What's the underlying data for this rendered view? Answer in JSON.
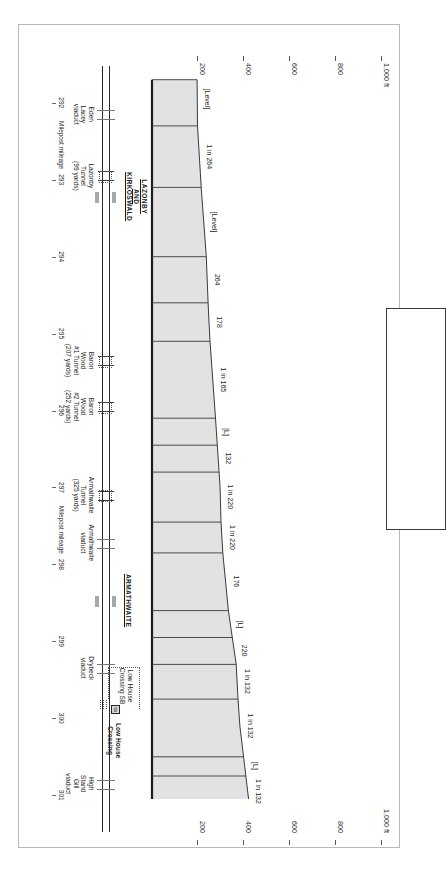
{
  "figure": {
    "kind": "railway-gradient-profile",
    "orientation": "rotated-90-clockwise",
    "elevation_axis": {
      "unit_label": "1,000 ft",
      "ticks": [
        "1,000 ft",
        "800",
        "600",
        "400",
        "200"
      ],
      "values": [
        1000,
        800,
        600,
        400,
        200
      ]
    },
    "mileage_axis": {
      "caption": "Milepost mileage",
      "ticks": [
        "292",
        "293",
        "294",
        "295",
        "296",
        "297",
        "298",
        "299",
        "300",
        "301"
      ],
      "values": [
        292,
        293,
        294,
        295,
        296,
        297,
        298,
        299,
        300,
        301
      ]
    }
  },
  "chart_data": {
    "type": "area",
    "title": "",
    "xlabel": "Milepost mileage",
    "ylabel": "1,000 ft",
    "xlim": [
      291.6,
      301.4
    ],
    "ylim": [
      0,
      1000
    ],
    "grid": false,
    "legend": "none",
    "x": [
      291.7,
      292.3,
      293.1,
      294.0,
      294.6,
      294.85,
      295.1,
      296.1,
      297.0,
      297.45,
      297.85,
      298.6,
      299.3,
      299.75,
      300.1,
      301.05
    ],
    "values": [
      196,
      198,
      214,
      236,
      244,
      248,
      252,
      276,
      296,
      300,
      308,
      332,
      366,
      374,
      382,
      420
    ],
    "gradient_segments": [
      {
        "label": "[Level]",
        "from_mp": 291.7,
        "to_mp": 292.3
      },
      {
        "label": "1 in 264",
        "from_mp": 292.3,
        "to_mp": 293.1
      },
      {
        "label": "[Level]",
        "from_mp": 293.1,
        "to_mp": 294.0
      },
      {
        "label": "264",
        "from_mp": 294.0,
        "to_mp": 294.6
      },
      {
        "label": "178",
        "from_mp": 294.6,
        "to_mp": 295.1
      },
      {
        "label": "1 in 165",
        "from_mp": 295.1,
        "to_mp": 296.1
      },
      {
        "label": "[L]",
        "from_mp": 296.1,
        "to_mp": 296.45
      },
      {
        "label": "132",
        "from_mp": 296.45,
        "to_mp": 296.8
      },
      {
        "label": "1 in 220",
        "from_mp": 296.8,
        "to_mp": 297.45
      },
      {
        "label": "1 in 220",
        "from_mp": 297.45,
        "to_mp": 297.85
      },
      {
        "label": "176",
        "from_mp": 297.85,
        "to_mp": 298.6
      },
      {
        "label": "[L]",
        "from_mp": 298.6,
        "to_mp": 298.95
      },
      {
        "label": "220",
        "from_mp": 298.95,
        "to_mp": 299.3
      },
      {
        "label": "1 in 132",
        "from_mp": 299.3,
        "to_mp": 299.75
      },
      {
        "label": "1 in 132",
        "from_mp": 299.75,
        "to_mp": 300.5
      },
      {
        "label": "[L]",
        "from_mp": 300.5,
        "to_mp": 300.75
      },
      {
        "label": "1 in 132",
        "from_mp": 300.75,
        "to_mp": 301.2
      }
    ]
  },
  "gradient_labels": [
    {
      "text": "[Level]",
      "mp": 291.95
    },
    {
      "text": "1 in 264",
      "mp": 292.7
    },
    {
      "text": "[Level]",
      "mp": 293.55
    },
    {
      "text": "264",
      "mp": 294.3
    },
    {
      "text": "178",
      "mp": 294.85
    },
    {
      "text": "1 in 165",
      "mp": 295.6
    },
    {
      "text": "[L]",
      "mp": 296.28
    },
    {
      "text": "132",
      "mp": 296.62
    },
    {
      "text": "1 in 220",
      "mp": 297.12
    },
    {
      "text": "1 in 220",
      "mp": 297.65
    },
    {
      "text": "176",
      "mp": 298.22
    },
    {
      "text": "[L]",
      "mp": 298.78
    },
    {
      "text": "220",
      "mp": 299.12
    },
    {
      "text": "1 in 132",
      "mp": 299.52
    },
    {
      "text": "1 in 132",
      "mp": 300.1
    },
    {
      "text": "[L]",
      "mp": 300.62
    },
    {
      "text": "1 in 132",
      "mp": 300.95
    }
  ],
  "stations": [
    {
      "name_lines": [
        "LAZONBY",
        "AND",
        "KIRKOSWALD"
      ],
      "mp": 293.05
    },
    {
      "name_lines": [
        "ARMATHWAITE"
      ],
      "mp": 298.3
    }
  ],
  "features": [
    {
      "label_lines": [
        "Eden",
        "Lacey",
        "viaduct"
      ],
      "mp": 292.15,
      "kind": "viaduct"
    },
    {
      "label_lines": [
        "Lazonby",
        "Tunnel",
        "(99 yards)"
      ],
      "mp": 292.95,
      "kind": "tunnel",
      "length_yards": 99
    },
    {
      "label_lines": [
        "Baron",
        "Wood",
        "#1 Tunnel",
        "(207 yards)"
      ],
      "mp": 295.35,
      "kind": "tunnel",
      "length_yards": 207
    },
    {
      "label_lines": [
        "Baron",
        "Wood",
        "#2 Tunnel",
        "(252 yards)"
      ],
      "mp": 295.95,
      "kind": "tunnel",
      "length_yards": 252
    },
    {
      "label_lines": [
        "Armathwaite",
        "Tunnel",
        "(325 yards)"
      ],
      "mp": 297.1,
      "kind": "tunnel",
      "length_yards": 325
    },
    {
      "label_lines": [
        "Armathwaite",
        "viaduct"
      ],
      "mp": 297.72,
      "kind": "viaduct"
    },
    {
      "label_lines": [
        "Drybeck",
        "viaduct"
      ],
      "mp": 299.35,
      "kind": "viaduct"
    },
    {
      "label_lines": [
        "High",
        "Stand",
        "Gill",
        "viaduct"
      ],
      "mp": 300.85,
      "kind": "viaduct"
    }
  ],
  "crossings": [
    {
      "bold_label_lines": [
        "Low House",
        "Crossing"
      ],
      "callout_label_lines": [
        "Low House",
        "Crossing SB"
      ],
      "signal_box_glyph": "SB",
      "mp": 299.88
    }
  ],
  "key_box": {
    "content": ""
  }
}
